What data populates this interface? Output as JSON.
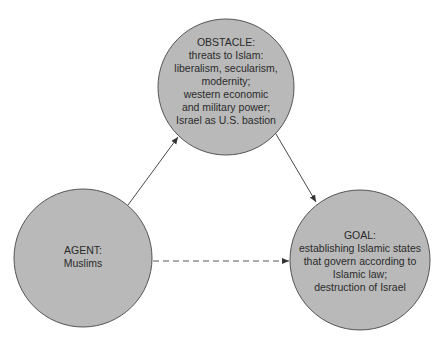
{
  "diagram": {
    "nodes": {
      "obstacle": {
        "title": "OBSTACLE:",
        "lines": [
          "threats to Islam:",
          "liberalism, secularism,",
          "modernity;",
          "western economic",
          "and military power;",
          "Israel as U.S. bastion"
        ]
      },
      "agent": {
        "title": "AGENT:",
        "lines": [
          "Muslims"
        ]
      },
      "goal": {
        "title": "GOAL:",
        "lines": [
          "establishing Islamic states",
          "that govern according to",
          "Islamic law;",
          "destruction of Israel"
        ]
      }
    },
    "edges": [
      {
        "from": "agent",
        "to": "obstacle",
        "style": "solid"
      },
      {
        "from": "obstacle",
        "to": "goal",
        "style": "solid"
      },
      {
        "from": "agent",
        "to": "goal",
        "style": "dashed"
      }
    ],
    "colors": {
      "node_fill": "#b9b9b9",
      "node_stroke": "#555555",
      "edge": "#333333"
    }
  }
}
